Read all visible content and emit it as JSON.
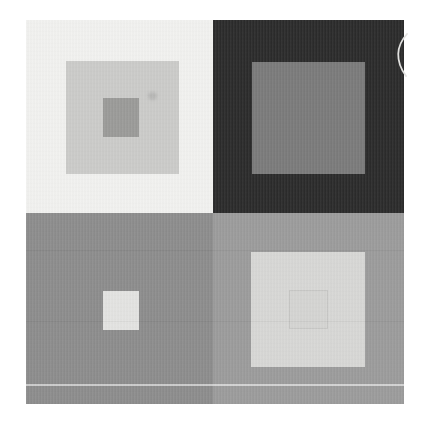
{
  "page": {
    "background": "#ffffff"
  },
  "figure": {
    "quadrants": {
      "top_left": {
        "background": "#f1f1ef",
        "squares": {
          "outer": "#cbcbc9",
          "inner": "#9a9a98"
        }
      },
      "top_right": {
        "background": "#2a2a2a",
        "squares": {
          "inner": "#7a7a7a"
        }
      },
      "bottom_left": {
        "background": "#8c8c8c",
        "squares": {
          "inner": "#e3e3e1"
        }
      },
      "bottom_right": {
        "background": "#9b9b9b",
        "squares": {
          "outer": "#d7d7d5",
          "inner_outline": "#c6c6c4",
          "inner_fill": "#d4d4d2"
        }
      }
    },
    "artifacts": {
      "light_scan_line": "rgba(255,255,255,0.55)",
      "band_line": "rgba(0,0,0,0.045)",
      "smudge": "rgba(130,130,128,0.28)",
      "scratch_arc": "#e2e2e0"
    }
  }
}
